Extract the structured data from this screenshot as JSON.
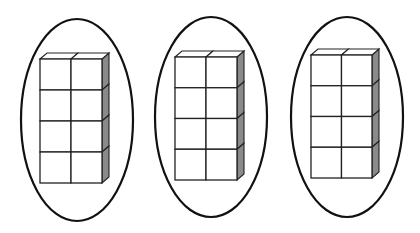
{
  "diagram": {
    "colors": {
      "outline": "#111111",
      "cube_face": "#ffffff",
      "cube_side": "#8a8a8a",
      "background": "#ffffff"
    },
    "groups": [
      {
        "ellipse": {
          "cx": 77,
          "cy": 120,
          "rx": 56,
          "ry": 101
        },
        "block": {
          "x": 40,
          "y": 59,
          "w": 62,
          "h": 124,
          "cols": 2,
          "rows": 4,
          "depth_dx": 7,
          "depth_dy": -6
        }
      },
      {
        "ellipse": {
          "cx": 211,
          "cy": 117,
          "rx": 56,
          "ry": 100
        },
        "block": {
          "x": 175,
          "y": 57,
          "w": 62,
          "h": 123,
          "cols": 2,
          "rows": 4,
          "depth_dx": 7,
          "depth_dy": -6
        }
      },
      {
        "ellipse": {
          "cx": 347,
          "cy": 117,
          "rx": 56,
          "ry": 100
        },
        "block": {
          "x": 311,
          "y": 55,
          "w": 61,
          "h": 123,
          "cols": 2,
          "rows": 4,
          "depth_dx": 7,
          "depth_dy": -6
        }
      }
    ]
  }
}
